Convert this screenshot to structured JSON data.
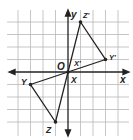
{
  "figure": {
    "type": "coordinate-grid-transformation",
    "axes": {
      "x_label": "x",
      "y_label": "y",
      "origin_label": "O"
    },
    "grid": {
      "x_min": -4,
      "x_max": 4,
      "y_min": -5,
      "y_max": 4,
      "unit_px": 12.5,
      "origin_px": [
        68,
        72
      ]
    },
    "preimage": {
      "name": "triangle XYZ",
      "vertices": [
        {
          "label": "X",
          "x": 0,
          "y": 0
        },
        {
          "label": "Y",
          "x": -3,
          "y": -1
        },
        {
          "label": "Z",
          "x": -1,
          "y": -4
        }
      ]
    },
    "image": {
      "name": "triangle X'Y'Z'",
      "vertices": [
        {
          "label": "X'",
          "x": 0,
          "y": 0
        },
        {
          "label": "Y'",
          "x": 3,
          "y": 1
        },
        {
          "label": "Z'",
          "x": 1,
          "y": 4
        }
      ]
    },
    "colors": {
      "grid": "#b8b8b8",
      "axes": "#222222",
      "triangle": "#222222",
      "background": "#ffffff"
    }
  }
}
